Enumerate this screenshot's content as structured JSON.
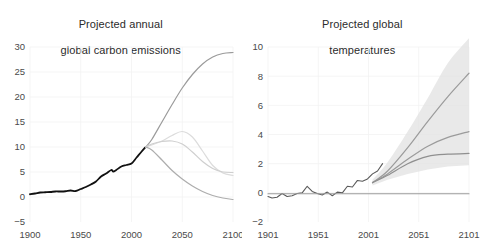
{
  "figure": {
    "background": "#ffffff",
    "panels": 2
  },
  "chart_data": [
    {
      "type": "line",
      "title": "Projected annual\nglobal carbon emissions",
      "title_line1": "Projected annual",
      "title_line2": "global carbon emissions",
      "xlabel": "",
      "ylabel": "",
      "xlim": [
        1900,
        2100
      ],
      "ylim": [
        -5,
        30
      ],
      "xticks": [
        1900,
        1950,
        2000,
        2050,
        2100
      ],
      "xticklabels": [
        "1900",
        "1950",
        "2000",
        "2050",
        "2100"
      ],
      "yticks": [
        -5,
        0,
        5,
        10,
        15,
        20,
        25,
        30
      ],
      "yticklabels": [
        "-5",
        "0",
        "5",
        "10",
        "15",
        "20",
        "25",
        "30"
      ],
      "grid": true,
      "grid_color": "#f2f2f2",
      "legend": "none",
      "series": [
        {
          "name": "historical emissions",
          "color": "#111111",
          "width": 1.8,
          "x": [
            1900,
            1905,
            1910,
            1915,
            1920,
            1925,
            1930,
            1935,
            1940,
            1945,
            1950,
            1955,
            1960,
            1965,
            1970,
            1975,
            1980,
            1982,
            1985,
            1990,
            1995,
            2000,
            2005,
            2010,
            2014
          ],
          "values": [
            0.55,
            0.7,
            0.9,
            0.95,
            1.0,
            1.1,
            1.1,
            1.15,
            1.3,
            1.2,
            1.6,
            2.0,
            2.5,
            3.1,
            4.1,
            4.7,
            5.4,
            5.1,
            5.4,
            6.1,
            6.4,
            6.7,
            7.9,
            9.1,
            10.0
          ]
        },
        {
          "name": "RCP8.5 high emissions",
          "color": "#9b9b9b",
          "width": 1.2,
          "x": [
            2014,
            2020,
            2030,
            2040,
            2050,
            2060,
            2070,
            2080,
            2090,
            2100
          ],
          "values": [
            10.0,
            11.5,
            15.0,
            18.5,
            21.8,
            24.5,
            26.6,
            28.0,
            28.7,
            28.9
          ]
        },
        {
          "name": "RCP6.0 mid-high emissions",
          "color": "#dcdcdc",
          "width": 1.2,
          "x": [
            2014,
            2020,
            2030,
            2040,
            2050,
            2060,
            2070,
            2080,
            2090,
            2100
          ],
          "values": [
            10.0,
            10.4,
            11.2,
            12.3,
            13.1,
            12.0,
            9.2,
            6.3,
            4.8,
            4.3
          ]
        },
        {
          "name": "RCP4.5 mid emissions",
          "color": "#cfcfcf",
          "width": 1.2,
          "x": [
            2014,
            2020,
            2030,
            2040,
            2050,
            2060,
            2070,
            2080,
            2090,
            2100
          ],
          "values": [
            10.0,
            10.6,
            11.1,
            11.2,
            10.6,
            9.0,
            7.1,
            5.7,
            5.0,
            4.9
          ]
        },
        {
          "name": "RCP2.6 low emissions",
          "color": "#adadad",
          "width": 1.2,
          "x": [
            2014,
            2020,
            2030,
            2040,
            2050,
            2060,
            2070,
            2080,
            2090,
            2100
          ],
          "values": [
            10.0,
            9.4,
            7.4,
            5.3,
            3.6,
            2.2,
            1.1,
            0.3,
            -0.2,
            -0.5
          ]
        }
      ]
    },
    {
      "type": "line",
      "title": "Projected global\ntemperatures",
      "title_line1": "Projected global",
      "title_line2": "temperatures",
      "xlabel": "",
      "ylabel": "",
      "xlim": [
        1901,
        2101
      ],
      "ylim": [
        -2,
        10
      ],
      "xticks": [
        1901,
        1951,
        2001,
        2051,
        2101
      ],
      "xticklabels": [
        "1901",
        "1951",
        "2001",
        "2051",
        "2101"
      ],
      "yticks": [
        -2,
        0,
        2,
        4,
        6,
        8,
        10
      ],
      "yticklabels": [
        "-2",
        "0",
        "2",
        "4",
        "6",
        "8",
        "10"
      ],
      "grid": true,
      "grid_color": "#f2f2f2",
      "legend": "none",
      "uncertainty_band": {
        "name": "projection uncertainty range",
        "color": "#e2e2e2",
        "x": [
          2005,
          2020,
          2040,
          2060,
          2080,
          2101
        ],
        "upper": [
          0.9,
          2.1,
          4.2,
          6.5,
          8.9,
          10.6
        ],
        "lower": [
          0.5,
          0.9,
          1.3,
          1.6,
          1.8,
          1.9
        ]
      },
      "series": [
        {
          "name": "observed temperature anomaly",
          "color": "#5a5a5a",
          "width": 1.1,
          "x": [
            1901,
            1905,
            1910,
            1915,
            1920,
            1925,
            1930,
            1935,
            1940,
            1945,
            1950,
            1955,
            1960,
            1965,
            1970,
            1975,
            1980,
            1985,
            1990,
            1995,
            2000,
            2005,
            2010,
            2015
          ],
          "values": [
            -0.25,
            -0.35,
            -0.3,
            -0.05,
            -0.25,
            -0.2,
            -0.05,
            0.0,
            0.45,
            0.1,
            -0.05,
            -0.15,
            0.05,
            -0.2,
            0.05,
            0.0,
            0.45,
            0.4,
            0.85,
            0.8,
            0.95,
            1.3,
            1.5,
            2.0
          ]
        },
        {
          "name": "RCP8.5 projection",
          "color": "#9b9b9b",
          "width": 1.2,
          "x": [
            2005,
            2020,
            2040,
            2060,
            2080,
            2101
          ],
          "values": [
            0.7,
            1.5,
            3.1,
            4.9,
            6.6,
            8.2
          ]
        },
        {
          "name": "RCP6.0 projection",
          "color": "#9b9b9b",
          "width": 1.2,
          "x": [
            2005,
            2020,
            2040,
            2060,
            2080,
            2101
          ],
          "values": [
            0.7,
            1.3,
            2.3,
            3.2,
            3.8,
            4.2
          ]
        },
        {
          "name": "RCP4.5 projection",
          "color": "#8f8f8f",
          "width": 1.2,
          "x": [
            2005,
            2020,
            2040,
            2060,
            2080,
            2101
          ],
          "values": [
            0.7,
            1.2,
            2.0,
            2.5,
            2.65,
            2.7
          ]
        },
        {
          "name": "baseline zero line",
          "color": "#9b9b9b",
          "width": 1.1,
          "x": [
            1901,
            2101
          ],
          "values": [
            -0.06,
            -0.06
          ]
        }
      ]
    }
  ]
}
